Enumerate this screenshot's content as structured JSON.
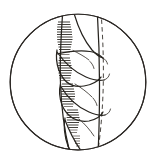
{
  "figure": {
    "style": "engraving / pen-and-ink hatching",
    "frame_shape": "circle",
    "caption": "",
    "colors": {
      "background": "#ffffff",
      "ink": "#27241f",
      "frame_stroke": "#2b2724",
      "hatch": "#2e2a25",
      "hatch_light": "#4a443c",
      "paper": "#ffffff"
    },
    "frame": {
      "center_x": 78,
      "center_y": 82,
      "radius": 68.5,
      "stroke_width": 1.15
    },
    "elements": [
      {
        "name": "circular-frame",
        "type": "circle",
        "label": "Circular vignette border"
      },
      {
        "name": "central-stem",
        "type": "stem",
        "label": "Central vertical stem axis"
      },
      {
        "name": "dashed-center-line",
        "type": "dashed-line",
        "label": "Dashed construction axis of stem"
      },
      {
        "name": "leaf-sheath-1",
        "type": "sheath",
        "label": "Upper leaf sheath"
      },
      {
        "name": "leaf-sheath-2",
        "type": "sheath",
        "label": "Second leaf sheath"
      },
      {
        "name": "leaf-sheath-3",
        "type": "sheath",
        "label": "Third leaf sheath"
      },
      {
        "name": "leaf-sheath-4",
        "type": "sheath",
        "label": "Lower leaf sheath"
      },
      {
        "name": "hatching-shadow",
        "type": "texture",
        "label": "Horizontal hatch shading on left of stem"
      }
    ],
    "annotations": []
  }
}
